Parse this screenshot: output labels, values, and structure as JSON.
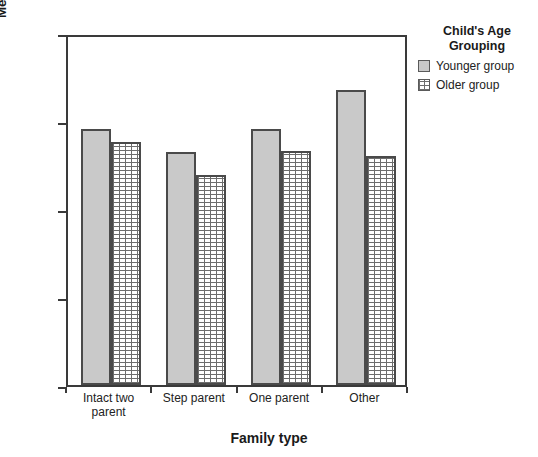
{
  "chart_data": {
    "type": "bar",
    "title": "",
    "xlabel": "Family type",
    "ylabel": "Mean Piers-Harris Self Esteem total score",
    "categories": [
      "Intact two parent",
      "Step parent",
      "One parent",
      "Other"
    ],
    "series": [
      {
        "name": "Younger group",
        "values": [
          59.1,
          56.5,
          59.1,
          63.5
        ],
        "color": "#c9c9c9",
        "pattern": "solid"
      },
      {
        "name": "Older group",
        "values": [
          57.6,
          53.9,
          56.6,
          56.0
        ],
        "color": "#ffffff",
        "pattern": "dotted-grid"
      }
    ],
    "ylim": [
      30,
      70
    ],
    "yticks": [
      30,
      40,
      50,
      60,
      70
    ],
    "ytick_labels": [
      "30",
      "40",
      "50",
      "60",
      "70"
    ],
    "grid": false,
    "legend": {
      "title": "Child's Age Grouping",
      "position": "right"
    }
  },
  "legend": {
    "title_line1": "Child's Age",
    "title_line2": "Grouping",
    "items": [
      {
        "label": "Younger group"
      },
      {
        "label": "Older group"
      }
    ]
  },
  "axes": {
    "y_title": "Mean Piers-Harris Self Esteem total score",
    "x_title": "Family type"
  },
  "x_categories": [
    {
      "line1": "Intact two",
      "line2": "parent"
    },
    {
      "line1": "Step parent",
      "line2": ""
    },
    {
      "line1": "One parent",
      "line2": ""
    },
    {
      "line1": "Other",
      "line2": ""
    }
  ]
}
